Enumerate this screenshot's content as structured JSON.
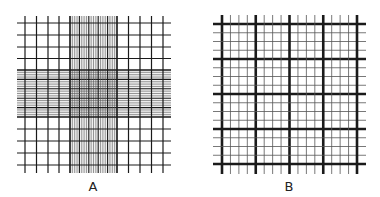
{
  "figure": {
    "panels": [
      {
        "id": "A",
        "label": "A",
        "description": "Improved Neubauer counting chamber grid with dense central counting area",
        "bounds": {
          "x0": 25,
          "x1": 163,
          "y0": 23,
          "y1": 165
        },
        "outer_lines_x": [
          25,
          36.5,
          48,
          59,
          70,
          117,
          128.5,
          140,
          151.5,
          163
        ],
        "outer_lines_y": [
          23,
          35,
          47,
          58.5,
          70,
          117,
          129,
          141,
          153,
          165
        ],
        "center_block": {
          "x0": 70,
          "x1": 117,
          "y0": 70,
          "y1": 117,
          "subdivisions": 20
        },
        "label_pos": {
          "x": 93,
          "y": 180
        }
      },
      {
        "id": "B",
        "label": "B",
        "description": "Grid with 16 x 16 fine divisions and thick lines every 4 divisions",
        "bounds": {
          "x0": 222,
          "x1": 357,
          "y0": 24,
          "y1": 164
        },
        "divisions": 16,
        "thick_every": 4,
        "label_pos": {
          "x": 289,
          "y": 180
        }
      }
    ],
    "colors": {
      "line": "#1a1a1a",
      "thin_line": "#555555",
      "background": "#ffffff"
    }
  }
}
